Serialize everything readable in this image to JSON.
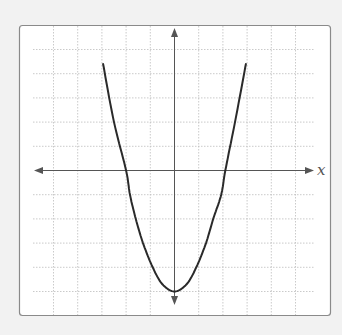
{
  "chart_data": {
    "type": "line",
    "title": "",
    "xlabel": "x",
    "ylabel": "",
    "grid": true,
    "legend": null,
    "xlim": [
      -6,
      6
    ],
    "ylim": [
      -6,
      6
    ],
    "grid_step": 1,
    "axes_arrows": true,
    "series": [
      {
        "name": "parabola",
        "description": "upward-opening parabola, vertex near (0, -5), x-intercepts near -2 and 2",
        "color": "#2a2a2a",
        "x": [
          -2.95,
          -2.5,
          -2.0,
          -1.84,
          -1.6,
          -1.3,
          -0.9,
          -0.5,
          0,
          0.5,
          0.9,
          1.3,
          1.6,
          1.93,
          2.1,
          2.5,
          2.95
        ],
        "y": [
          4.4,
          2.0,
          0,
          -1,
          -2,
          -3,
          -4,
          -4.7,
          -5,
          -4.7,
          -4,
          -3,
          -2,
          -1,
          0,
          2.0,
          4.4
        ]
      }
    ]
  },
  "labels": {
    "x_axis": "x"
  },
  "colors": {
    "background": "#f2f2f2",
    "plot_area": "#ffffff",
    "frame": "#8a8a8a",
    "grid": "#bdbdbd",
    "axis": "#555555",
    "curve": "#2a2a2a"
  }
}
